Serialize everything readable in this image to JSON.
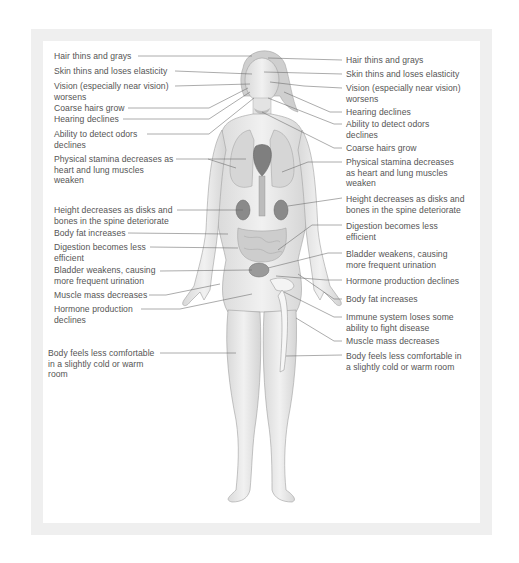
{
  "diagram": {
    "colors": {
      "frame": "#efefef",
      "background": "#ffffff",
      "text": "#555555",
      "leader_line": "#666666",
      "skin": "#e6e6e6",
      "outline": "#9a9a9a",
      "organ": "#8c8c8c"
    },
    "left_labels": [
      {
        "text": "Hair thins and grays",
        "x": 54,
        "y": 51,
        "w": 140
      },
      {
        "text": "Skin thins and loses elasticity",
        "x": 54,
        "y": 66,
        "w": 160
      },
      {
        "text": "Vision (especially near vision)\nworsens",
        "x": 54,
        "y": 81,
        "w": 160
      },
      {
        "text": "Coarse hairs grow",
        "x": 54,
        "y": 104,
        "w": 140
      },
      {
        "text": "Hearing declines",
        "x": 54,
        "y": 115,
        "w": 140
      },
      {
        "text": "Ability to detect odors\ndeclines",
        "x": 54,
        "y": 129,
        "w": 140
      },
      {
        "text": "Physical stamina decreases as\nheart and lung muscles\nweaken",
        "x": 54,
        "y": 154,
        "w": 160
      },
      {
        "text": "Height decreases as disks and\nbones in the spine deteriorate",
        "x": 54,
        "y": 205,
        "w": 160
      },
      {
        "text": "Body fat increases",
        "x": 54,
        "y": 228,
        "w": 140
      },
      {
        "text": "Digestion becomes less\nefficient",
        "x": 54,
        "y": 242,
        "w": 140
      },
      {
        "text": "Bladder weakens, causing\nmore frequent urination",
        "x": 54,
        "y": 265,
        "w": 140
      },
      {
        "text": "Muscle mass decreases",
        "x": 54,
        "y": 290,
        "w": 140
      },
      {
        "text": "Hormone production\ndeclines",
        "x": 54,
        "y": 304,
        "w": 140
      },
      {
        "text": "Body feels less comfortable\nin a slightly cold or warm\nroom",
        "x": 48,
        "y": 347,
        "w": 150
      }
    ],
    "right_labels": [
      {
        "text": "Hair thins and grays",
        "x": 346,
        "y": 55,
        "w": 140
      },
      {
        "text": "Skin thins and loses elasticity",
        "x": 346,
        "y": 69,
        "w": 140
      },
      {
        "text": "Vision (especially near vision)\nworsens",
        "x": 346,
        "y": 83,
        "w": 140
      },
      {
        "text": "Hearing declines",
        "x": 346,
        "y": 105,
        "w": 140
      },
      {
        "text": "Ability to detect odors\ndeclines",
        "x": 346,
        "y": 118,
        "w": 140
      },
      {
        "text": "Coarse hairs grow",
        "x": 346,
        "y": 142,
        "w": 140
      },
      {
        "text": "Physical stamina decreases\nas heart and lung muscles\nweaken",
        "x": 346,
        "y": 156,
        "w": 140
      },
      {
        "text": "Height decreases as disks and\nbones in the spine deteriorate",
        "x": 346,
        "y": 193,
        "w": 145
      },
      {
        "text": "Digestion becomes less\nefficient",
        "x": 346,
        "y": 220,
        "w": 140
      },
      {
        "text": "Bladder weakens, causing\nmore frequent urination",
        "x": 346,
        "y": 248,
        "w": 140
      },
      {
        "text": "Hormone production declines",
        "x": 346,
        "y": 275,
        "w": 145
      },
      {
        "text": "Body fat increases",
        "x": 346,
        "y": 294,
        "w": 140
      },
      {
        "text": "Immune system loses some\nability to fight disease",
        "x": 346,
        "y": 312,
        "w": 140
      },
      {
        "text": "Muscle mass decreases",
        "x": 346,
        "y": 336,
        "w": 140
      },
      {
        "text": "Body feels less comfortable in\na slightly cold or warm room",
        "x": 346,
        "y": 351,
        "w": 145
      }
    ]
  }
}
